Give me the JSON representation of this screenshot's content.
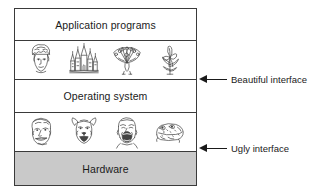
{
  "diagram": {
    "colors": {
      "border": "#3a3a3a",
      "text": "#1a1a1a",
      "hardware_fill": "#c9c9c9",
      "band_fill": "#ffffff"
    },
    "bands": [
      {
        "id": "application-programs",
        "label": "Application programs",
        "kind": "label"
      },
      {
        "id": "beautiful-icons",
        "label": "",
        "kind": "icons"
      },
      {
        "id": "operating-system",
        "label": "Operating system",
        "kind": "label"
      },
      {
        "id": "ugly-icons",
        "label": "",
        "kind": "icons"
      },
      {
        "id": "hardware",
        "label": "Hardware",
        "kind": "label"
      }
    ],
    "beautiful_icons": [
      {
        "name": "crowned-head-icon",
        "description": "Ornate crowned woman's head"
      },
      {
        "name": "castle-icon",
        "description": "Fairy-tale castle with spires"
      },
      {
        "name": "peacock-icon",
        "description": "Peacock with fanned tail"
      },
      {
        "name": "flower-icon",
        "description": "Iris flower with leaves"
      }
    ],
    "ugly_icons": [
      {
        "name": "grinning-face-icon",
        "description": "Grinning caricature face"
      },
      {
        "name": "dog-face-icon",
        "description": "Howling dog face"
      },
      {
        "name": "screaming-face-icon",
        "description": "Screaming man's face"
      },
      {
        "name": "toad-icon",
        "description": "Warty toad"
      }
    ],
    "annotations": [
      {
        "id": "beautiful-interface",
        "label": "Beautiful interface",
        "points_to": "operating-system-top-boundary"
      },
      {
        "id": "ugly-interface",
        "label": "Ugly interface",
        "points_to": "hardware-top-boundary"
      }
    ]
  }
}
